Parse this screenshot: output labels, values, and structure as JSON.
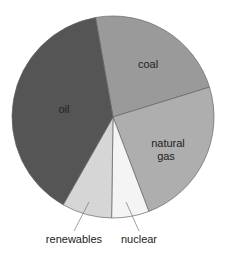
{
  "chart_data": {
    "type": "pie",
    "title": "",
    "start_angle_deg": -10,
    "slices": [
      {
        "label": "coal",
        "value": 23,
        "color": "#9a9a9a"
      },
      {
        "label": "natural gas",
        "value": 24,
        "color": "#aeaeae"
      },
      {
        "label": "nuclear",
        "value": 6,
        "color": "#f4f4f4"
      },
      {
        "label": "renewables",
        "value": 8,
        "color": "#d6d6d6"
      },
      {
        "label": "oil",
        "value": 39,
        "color": "#555555"
      }
    ],
    "legend": "none",
    "labels": {
      "coal": "coal",
      "natural_gas_line1": "natural",
      "natural_gas_line2": "gas",
      "oil": "oil",
      "renewables": "renewables",
      "nuclear": "nuclear"
    }
  }
}
